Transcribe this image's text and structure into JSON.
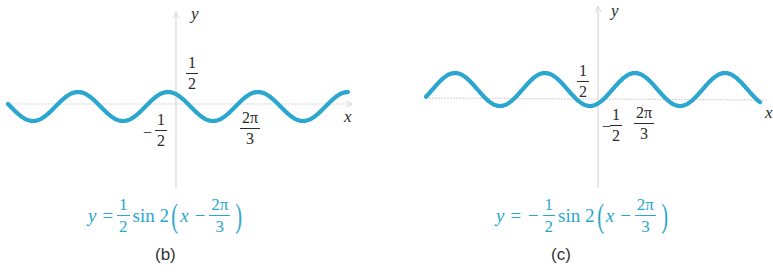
{
  "chart_data": [
    {
      "type": "line",
      "panel_label": "(b)",
      "equation": "y = 1/2 sin 2(x − 2π/3)",
      "xlabel": "x",
      "ylabel": "y",
      "y_tick_labels": [
        "1/2",
        "-1/2"
      ],
      "x_tick_labels": [
        "2π/3"
      ],
      "amplitude": 0.5,
      "period": "π",
      "phase_shift": "2π/3",
      "series": [
        {
          "name": "y = 1/2 sin 2(x − 2π/3)",
          "color": "#2aa6cf"
        }
      ],
      "grid": false
    },
    {
      "type": "line",
      "panel_label": "(c)",
      "equation": "y = −1/2 sin 2(x − 2π/3)",
      "xlabel": "x",
      "ylabel": "y",
      "y_tick_labels": [
        "1/2",
        "-1/2"
      ],
      "x_tick_labels": [
        "2π/3"
      ],
      "amplitude": 0.5,
      "period": "π",
      "phase_shift": "2π/3",
      "series": [
        {
          "name": "y = −1/2 sin 2(x − 2π/3)",
          "color": "#2aa6cf"
        }
      ],
      "grid": false
    }
  ],
  "panel_b": {
    "axis_y": "y",
    "axis_x": "x",
    "tick_half": {
      "num": "1",
      "den": "2"
    },
    "tick_neg_half": {
      "sign": "−",
      "num": "1",
      "den": "2"
    },
    "tick_2pi3": {
      "num": "2π",
      "den": "3"
    },
    "equation": {
      "lhs": "y =",
      "coef_num": "1",
      "coef_den": "2",
      "func": "sin 2",
      "open": "(",
      "x": "x −",
      "shift_num": "2π",
      "shift_den": "3",
      "close": ")"
    },
    "caption": "(b)"
  },
  "panel_c": {
    "axis_y": "y",
    "axis_x": "x",
    "tick_half": {
      "num": "1",
      "den": "2"
    },
    "tick_neg_half": {
      "sign": "−",
      "num": "1",
      "den": "2"
    },
    "tick_2pi3": {
      "num": "2π",
      "den": "3"
    },
    "equation": {
      "lhs": "y = −",
      "coef_num": "1",
      "coef_den": "2",
      "func": "sin 2",
      "open": "(",
      "x": "x −",
      "shift_num": "2π",
      "shift_den": "3",
      "close": ")"
    },
    "caption": "(c)"
  },
  "colors": {
    "curve": "#2aa6cf",
    "axis": "#d6d6d6",
    "text": "#2a2a2a",
    "equation": "#2aa6cf"
  }
}
